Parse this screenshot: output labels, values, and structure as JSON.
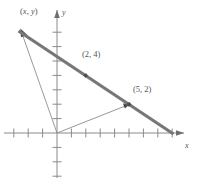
{
  "figure": {
    "background_color": "#ffffff",
    "axes": {
      "x_label": "x",
      "y_label": "y",
      "origin_px": [
        57,
        133
      ],
      "unit_px": 14.4,
      "x_range": [
        -4,
        9.5
      ],
      "y_range": [
        -3.5,
        8.5
      ],
      "axis_color": "#8a8a8a",
      "x_tick_values": [
        -3,
        -2,
        -1,
        1,
        2,
        3,
        4,
        5,
        6,
        7,
        8
      ],
      "y_tick_values": [
        -3,
        -2,
        -1,
        1,
        2,
        3,
        4,
        5,
        6,
        7
      ]
    },
    "labels": {
      "point_xy": "(x, y)",
      "point_xy_open": "(",
      "point_xy_x": "x",
      "point_xy_comma": ", ",
      "point_xy_y": "y",
      "point_xy_close": ")",
      "point_2_4": "(2, 4)",
      "point_5_2": "(5, 2)"
    },
    "line": {
      "name": "line-through-points",
      "color": "#777777",
      "width_px": 3.2,
      "through_points": [
        [
          2,
          4
        ],
        [
          5,
          2
        ]
      ],
      "slope": -0.6667,
      "y_intercept": 5.3333,
      "drawn_from": [
        -2.6,
        7.07
      ],
      "drawn_to": [
        8.0,
        0.0
      ]
    },
    "vectors": [
      {
        "name": "vector-to-xy",
        "from": [
          0,
          0
        ],
        "to": [
          -2.45,
          6.9
        ],
        "label": "(x, y)",
        "has_arrowhead": true,
        "color": "#8d8d8d"
      },
      {
        "name": "vector-to-5-2",
        "from": [
          0,
          0
        ],
        "to": [
          5,
          2
        ],
        "label": "(5, 2)",
        "has_arrowhead": true,
        "color": "#8d8d8d"
      }
    ],
    "points": [
      {
        "name": "point-2-4",
        "coords": [
          2,
          4
        ],
        "label": "(2, 4)"
      },
      {
        "name": "point-5-2",
        "coords": [
          5,
          2
        ],
        "label": "(5, 2)"
      }
    ]
  }
}
